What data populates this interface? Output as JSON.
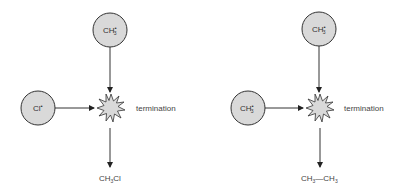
{
  "diagrams": [
    {
      "name": "methyl-chlorine-termination",
      "top_radical": {
        "base": "CH",
        "subscript": "3",
        "superscript": "•"
      },
      "left_radical": {
        "base": "Cl",
        "subscript": "",
        "superscript": "•"
      },
      "step_label": "termination",
      "product": {
        "parts": [
          {
            "text": "CH",
            "sub": "3"
          },
          {
            "text": "Cl",
            "sub": ""
          }
        ],
        "bond": ""
      }
    },
    {
      "name": "methyl-methyl-termination",
      "top_radical": {
        "base": "CH",
        "subscript": "3",
        "superscript": "•"
      },
      "left_radical": {
        "base": "CH",
        "subscript": "3",
        "superscript": "•"
      },
      "step_label": "termination",
      "product": {
        "parts": [
          {
            "text": "CH",
            "sub": "3"
          },
          {
            "text": "CH",
            "sub": "3"
          }
        ],
        "bond": "—"
      }
    }
  ],
  "colors": {
    "circle_fill": "#d9d9d9",
    "stroke": "#333333",
    "burst_fill": "#d9d9d9",
    "text": "#444444"
  }
}
